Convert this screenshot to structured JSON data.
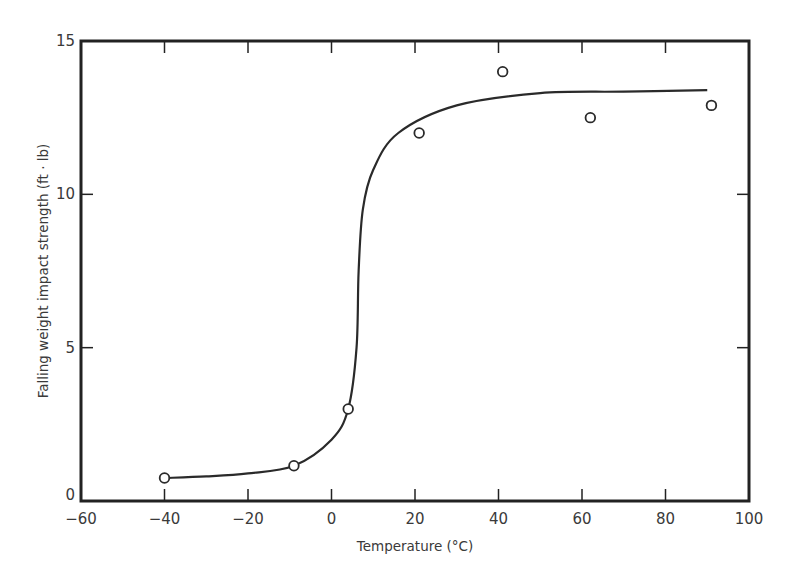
{
  "chart_data": {
    "type": "scatter",
    "title": "",
    "xlabel": "Temperature (°C)",
    "ylabel": "Falling weight impact strength (ft · lb)",
    "xlim": [
      -60,
      100
    ],
    "ylim": [
      0,
      15
    ],
    "x_ticks": [
      -60,
      -40,
      -20,
      0,
      20,
      40,
      60,
      80,
      100
    ],
    "x_tick_labels": [
      "−60",
      "−40",
      "−20",
      "0",
      "20",
      "40",
      "60",
      "80",
      "100"
    ],
    "y_ticks": [
      0,
      5,
      10,
      15
    ],
    "y_tick_labels": [
      "0",
      "5",
      "10",
      "15"
    ],
    "grid": false,
    "legend": null,
    "series": [
      {
        "name": "measured",
        "marker": "open-circle",
        "points": [
          {
            "x": -40,
            "y": 0.75
          },
          {
            "x": -9,
            "y": 1.15
          },
          {
            "x": 4,
            "y": 3.0
          },
          {
            "x": 21,
            "y": 12.0
          },
          {
            "x": 41,
            "y": 14.0
          },
          {
            "x": 62,
            "y": 12.5
          },
          {
            "x": 91,
            "y": 12.9
          }
        ]
      },
      {
        "name": "fitted curve",
        "marker": "line",
        "points": [
          {
            "x": -40,
            "y": 0.75
          },
          {
            "x": -30,
            "y": 0.8
          },
          {
            "x": -20,
            "y": 0.9
          },
          {
            "x": -9,
            "y": 1.15
          },
          {
            "x": 0,
            "y": 2.0
          },
          {
            "x": 4,
            "y": 3.0
          },
          {
            "x": 6,
            "y": 5.0
          },
          {
            "x": 6.5,
            "y": 7.5
          },
          {
            "x": 7.5,
            "y": 9.5
          },
          {
            "x": 10,
            "y": 10.8
          },
          {
            "x": 16,
            "y": 12.0
          },
          {
            "x": 30,
            "y": 12.9
          },
          {
            "x": 50,
            "y": 13.3
          },
          {
            "x": 70,
            "y": 13.35
          },
          {
            "x": 90,
            "y": 13.4
          }
        ]
      }
    ]
  },
  "style": {
    "axis_color": "#222222",
    "line_color": "#2a2a2a",
    "marker_fill": "#ffffff"
  }
}
